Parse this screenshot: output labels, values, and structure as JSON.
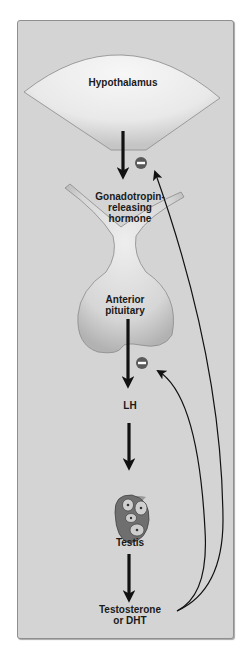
{
  "diagram": {
    "type": "endocrine-feedback-pathway",
    "nodes": [
      {
        "id": "hypothalamus",
        "label": "Hypothalamus"
      },
      {
        "id": "gnrh",
        "label_lines": [
          "Gonadotropin-",
          "releasing",
          "hormone"
        ]
      },
      {
        "id": "anterior_pituitary",
        "label_lines": [
          "Anterior",
          "pituitary"
        ]
      },
      {
        "id": "lh",
        "label": "LH"
      },
      {
        "id": "testis",
        "label": "Testis"
      },
      {
        "id": "testosterone",
        "label_lines": [
          "Testosterone",
          "or DHT"
        ]
      }
    ],
    "edges": [
      {
        "from": "hypothalamus",
        "to": "gnrh",
        "kind": "stimulates"
      },
      {
        "from": "anterior_pituitary",
        "to": "lh",
        "kind": "stimulates"
      },
      {
        "from": "lh",
        "to": "testis",
        "kind": "stimulates"
      },
      {
        "from": "testis",
        "to": "testosterone",
        "kind": "stimulates"
      },
      {
        "from": "testosterone",
        "to": "hypothalamus",
        "kind": "negative-feedback",
        "symbol": "−"
      },
      {
        "from": "testosterone",
        "to": "anterior_pituitary",
        "kind": "negative-feedback",
        "symbol": "−"
      }
    ],
    "inhibition_symbol": "minus-circle",
    "colors": {
      "panel": "#d4d4d4",
      "organ_fill": "#eeeeee",
      "organ_shade": "#bfbfbf",
      "arrow": "#111111",
      "inhibit_circle": "#5a5a5a",
      "testis_cell": "#c8c8c8"
    }
  }
}
